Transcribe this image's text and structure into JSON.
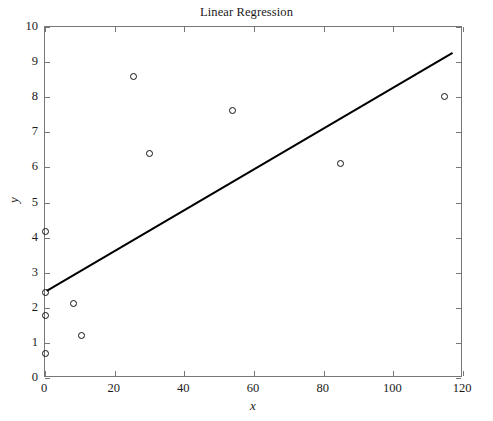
{
  "chart_data": {
    "type": "scatter",
    "title": "Linear Regression",
    "xlabel": "x",
    "ylabel": "y",
    "xlim": [
      0,
      120
    ],
    "ylim": [
      0,
      10
    ],
    "xticks": [
      0,
      20,
      40,
      60,
      80,
      100,
      120
    ],
    "yticks": [
      0,
      1,
      2,
      3,
      4,
      5,
      6,
      7,
      8,
      9,
      10
    ],
    "grid": false,
    "legend": null,
    "marker": "open-circle",
    "marker_color": "#111111",
    "line_color": "#000000",
    "points": [
      {
        "x": 0.0,
        "y": 4.17
      },
      {
        "x": 0.0,
        "y": 2.45
      },
      {
        "x": 0.0,
        "y": 1.77
      },
      {
        "x": 0.0,
        "y": 0.71
      },
      {
        "x": 8.3,
        "y": 2.11
      },
      {
        "x": 10.6,
        "y": 1.2
      },
      {
        "x": 25.3,
        "y": 8.6
      },
      {
        "x": 30.1,
        "y": 6.4
      },
      {
        "x": 53.7,
        "y": 7.61
      },
      {
        "x": 84.7,
        "y": 6.12
      },
      {
        "x": 114.6,
        "y": 8.02
      }
    ],
    "fit_line": {
      "name": "regression-line",
      "x": [
        0.5,
        117.0
      ],
      "y": [
        2.48,
        9.26
      ],
      "slope": 0.0582,
      "intercept": 2.45
    }
  }
}
